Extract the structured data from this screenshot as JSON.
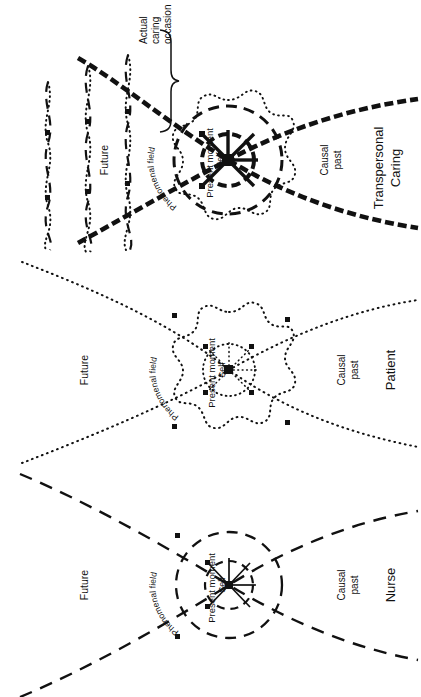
{
  "figure": {
    "orientation": "rotated-90-clockwise",
    "ink_color": "#111111",
    "background": "#ffffff"
  },
  "panels": [
    {
      "id": "transpersonal-caring",
      "title": "Transpersonal Caring",
      "title_lines": [
        "Transpersonal",
        "Caring"
      ],
      "line_style": "bold-dashed-with-dotted-overlay",
      "center_label": "Present moment",
      "inner_circle_label": "Self",
      "outer_field_label": "Phenomenal field",
      "future_label": "Future",
      "past_label": "Causal past",
      "past_label_lines": [
        "Causal",
        "past"
      ],
      "bracket_label": "Actual caring occasion",
      "bracket_label_lines": [
        "Actual",
        "caring",
        "occasion"
      ],
      "has_bracket": true,
      "has_interwoven_waves": true,
      "wave_count": 3
    },
    {
      "id": "patient",
      "title": "Patient",
      "title_lines": [
        "Patient"
      ],
      "line_style": "dotted",
      "center_label": "Present moment",
      "inner_circle_label": "Self",
      "outer_field_label": "Phenomenal field",
      "future_label": "Future",
      "past_label": "Causal past",
      "past_label_lines": [
        "Causal",
        "past"
      ],
      "has_bracket": false,
      "has_interwoven_waves": false
    },
    {
      "id": "nurse",
      "title": "Nurse",
      "title_lines": [
        "Nurse"
      ],
      "line_style": "dashed",
      "center_label": "Present moment",
      "inner_circle_label": "Self",
      "outer_field_label": "Phenomenal field",
      "future_label": "Future",
      "past_label": "Causal past",
      "past_label_lines": [
        "Causal",
        "past"
      ],
      "has_bracket": false,
      "has_interwoven_waves": false
    }
  ]
}
